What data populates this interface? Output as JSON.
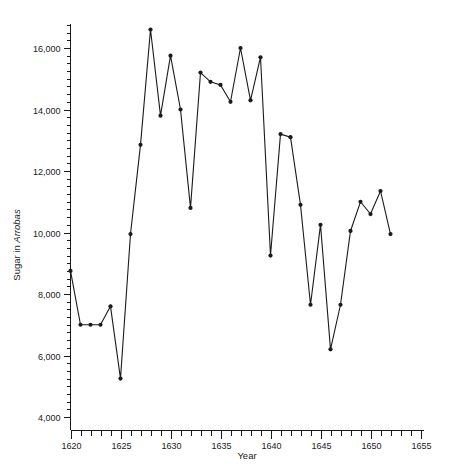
{
  "chart": {
    "title": "",
    "xlabel": "Year",
    "ylabel_plain": "Sugar in ",
    "ylabel_italic": "Arrobas",
    "ylabel_full": "Sugar in Arrobas"
  },
  "chart_data": {
    "type": "line",
    "title": "",
    "xlabel": "Year",
    "ylabel": "Sugar in Arrobas",
    "xlim": [
      1620,
      1655
    ],
    "ylim": [
      4000,
      16900
    ],
    "grid": false,
    "legend": "none",
    "x_major_ticks": [
      1620,
      1625,
      1630,
      1635,
      1640,
      1645,
      1650,
      1655
    ],
    "x_major_tick_labels": [
      "1620",
      "1625",
      "1630",
      "1635",
      "1640",
      "1645",
      "1650",
      "1655"
    ],
    "x_minor_tick_step": 1,
    "y_major_ticks": [
      4000,
      6000,
      8000,
      10000,
      12000,
      14000,
      16000
    ],
    "y_major_tick_labels": [
      "4,000",
      "6,000",
      "8,000",
      "10,000",
      "12,000",
      "14,000",
      "16,000"
    ],
    "y_minor_tick_step": 250,
    "marker": "filled-circle",
    "series": [
      {
        "name": "Sugar in Arrobas",
        "x": [
          1620,
          1621,
          1622,
          1623,
          1624,
          1625,
          1626,
          1627,
          1628,
          1629,
          1630,
          1631,
          1632,
          1633,
          1634,
          1635,
          1636,
          1637,
          1638,
          1639,
          1640,
          1641,
          1642,
          1643,
          1644,
          1645,
          1646,
          1647,
          1648,
          1649,
          1650,
          1651
        ],
        "values": [
          8750,
          7000,
          7000,
          7000,
          7600,
          5250,
          9950,
          12850,
          16600,
          13800,
          15750,
          14000,
          10800,
          15200,
          14900,
          14800,
          14250,
          16000,
          14300,
          15700,
          9250,
          13200,
          13100,
          10900,
          7650,
          10250,
          6200,
          7650,
          10050,
          11000,
          10600,
          11350
        ]
      }
    ],
    "extra_points": [
      {
        "x": 1652,
        "y": 9950
      }
    ]
  }
}
